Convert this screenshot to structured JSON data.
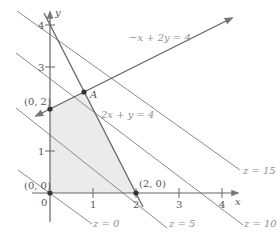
{
  "diagram": {
    "axes": {
      "x_label": "x",
      "y_label": "y",
      "x_ticks": [
        "0",
        "1",
        "2",
        "3",
        "4"
      ],
      "y_ticks": [
        "1",
        "3",
        "4"
      ]
    },
    "feasible_region_color": "#ebebeb",
    "constraints": [
      {
        "label": "−x + 2y = 4"
      },
      {
        "label": "2x + y = 4"
      }
    ],
    "vertices": [
      {
        "label": "(0, 0)"
      },
      {
        "label": "(0, 2)"
      },
      {
        "label": "A"
      },
      {
        "label": "(2, 0)"
      }
    ],
    "objective_levels": [
      {
        "label": "z = 0"
      },
      {
        "label": "z = 5"
      },
      {
        "label": "z = 10"
      },
      {
        "label": "z = 15"
      }
    ]
  }
}
